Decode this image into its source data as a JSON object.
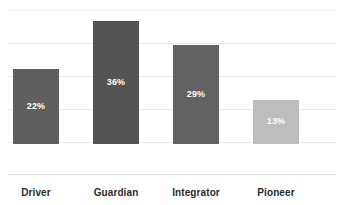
{
  "chart_data": {
    "type": "bar",
    "title": "",
    "subtitle": "",
    "xlabel": "",
    "ylabel": "",
    "categories": [
      "Driver",
      "Guardian",
      "Integrator",
      "Pioneer"
    ],
    "values": [
      22,
      36,
      29,
      13
    ],
    "value_labels": [
      "22%",
      "36%",
      "29%",
      "13%"
    ],
    "bar_colors": [
      "#5f5f5f",
      "#545454",
      "#626262",
      "#bdbdbd"
    ],
    "ylim": [
      0,
      48
    ],
    "grid": true,
    "gridlines": [
      8,
      16,
      24,
      32,
      40
    ],
    "legend": "none",
    "axis_color": "#e4e4e4",
    "grid_color": "#eaeaea",
    "label_color": "#2b2b2b",
    "value_label_color": "#ffffff",
    "background": "#ffffff"
  }
}
